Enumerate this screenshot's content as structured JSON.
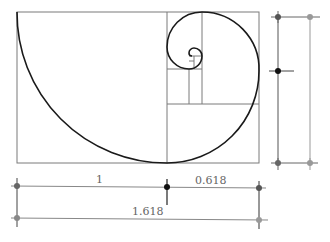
{
  "diagram": {
    "labels": {
      "short_segment": "1",
      "long_segment": "0.618",
      "total": "1.618"
    },
    "colors": {
      "spiral": "#1a1a1a",
      "grid": "#7a7a7a",
      "dot_dark": "#222222",
      "dot_gray": "#888888"
    }
  }
}
